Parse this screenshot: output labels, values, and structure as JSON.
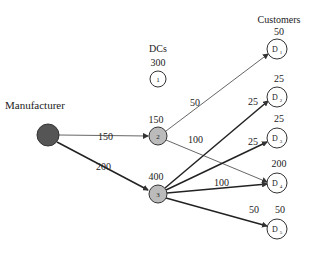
{
  "labels": {
    "manufacturer": "Manufacturer",
    "dcs": "DCs",
    "customers": "Customers"
  },
  "colors": {
    "manufacturer_fill": "#555555",
    "dc_active_fill": "#bbbbbb",
    "node_fill": "#ffffff",
    "stroke": "#333333"
  },
  "nodes": {
    "manufacturer": {
      "id": "M",
      "label": ""
    },
    "dcs": [
      {
        "id": "1",
        "label": "1",
        "capacity": "300",
        "active": false
      },
      {
        "id": "2",
        "label": "2",
        "capacity": "150",
        "active": true
      },
      {
        "id": "3",
        "label": "3",
        "capacity": "400",
        "active": true
      }
    ],
    "customers": [
      {
        "id": "D1",
        "label": "D",
        "sub": "1",
        "demand": "50"
      },
      {
        "id": "D2",
        "label": "D",
        "sub": "2",
        "demand": "25"
      },
      {
        "id": "D3",
        "label": "D",
        "sub": "3",
        "demand": "25"
      },
      {
        "id": "D4",
        "label": "D",
        "sub": "4",
        "demand": "200"
      },
      {
        "id": "D5",
        "label": "D",
        "sub": "5",
        "demand": "50"
      }
    ]
  },
  "edges": [
    {
      "from": "M",
      "to": "2",
      "flow": "150"
    },
    {
      "from": "M",
      "to": "3",
      "flow": "200"
    },
    {
      "from": "2",
      "to": "D1",
      "flow": "50"
    },
    {
      "from": "2",
      "to": "D4",
      "flow": "100"
    },
    {
      "from": "3",
      "to": "D2",
      "flow": "25"
    },
    {
      "from": "3",
      "to": "D3",
      "flow": "25"
    },
    {
      "from": "3",
      "to": "D4",
      "flow": "100"
    },
    {
      "from": "3",
      "to": "D5",
      "flow": "50"
    }
  ]
}
